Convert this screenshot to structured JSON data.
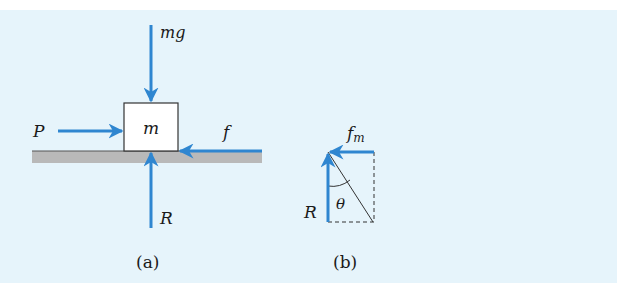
{
  "colors": {
    "panel_background": "#e6f4fb",
    "arrow": "#2f86d0",
    "ground": "#b9b9b9",
    "ground_edge": "#555555",
    "block_fill": "#ffffff",
    "block_stroke": "#333333"
  },
  "figure_a": {
    "caption": "(a)",
    "block_label": "m",
    "forces": {
      "weight": "mg",
      "push": "P",
      "friction": "f",
      "normal": "R"
    }
  },
  "figure_b": {
    "caption": "(b)",
    "forces": {
      "max_friction": "f",
      "max_friction_subscript": "m",
      "normal": "R"
    },
    "angle_label": "θ"
  }
}
